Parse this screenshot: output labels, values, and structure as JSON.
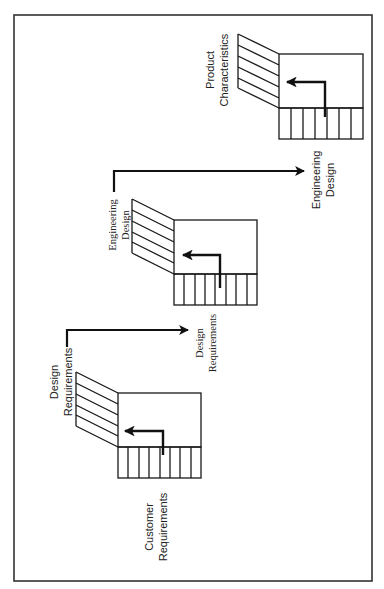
{
  "diagram": {
    "type": "QFD cascade (House of Quality chain), rotated 90°",
    "colors": {
      "stroke": "#1a1a1a",
      "background": "#ffffff",
      "text": "#222222"
    },
    "border": {
      "x": 14,
      "y": 15,
      "width": 358,
      "height": 566
    },
    "matrices": [
      {
        "id": "matrix-1",
        "name": "customer-to-design",
        "input_label": [
          "Customer",
          "Requirements"
        ],
        "output_label": [
          "Design",
          "Requirements"
        ],
        "box": {
          "x": 118,
          "y": 393,
          "w": 83,
          "h": 54
        },
        "stripe_h": 31,
        "skew_x": 76,
        "skew_rise": 21
      },
      {
        "id": "matrix-2",
        "name": "design-to-engineering",
        "input_label": [
          "Design",
          "Requirements"
        ],
        "output_label": [
          "Engineering",
          "Design"
        ],
        "box": {
          "x": 174,
          "y": 220,
          "w": 83,
          "h": 54
        },
        "stripe_h": 31,
        "skew_x": 132,
        "skew_rise": 21
      },
      {
        "id": "matrix-3",
        "name": "engineering-to-product",
        "input_label": [
          "Engineering",
          "Design"
        ],
        "output_label": [
          "Product",
          "Characteristics"
        ],
        "box": {
          "x": 279,
          "y": 54,
          "w": 84,
          "h": 54
        },
        "stripe_h": 31,
        "skew_x": 238,
        "skew_rise": 20
      }
    ],
    "labels": {
      "customer_requirements": [
        "Customer",
        "Requirements"
      ],
      "design_requirements_out": [
        "Design",
        "Requirements"
      ],
      "design_requirements_in": [
        "Design",
        "Requirements"
      ],
      "engineering_design_out": [
        "Engineering",
        "Design"
      ],
      "engineering_design_in": [
        "Engineering",
        "Design"
      ],
      "product_characteristics": [
        "Product",
        "Characteristics"
      ]
    },
    "connectors": [
      {
        "id": "connector-1",
        "from": "Design Requirements",
        "to": "Design Requirements",
        "points": [
          [
            67,
            347
          ],
          [
            67,
            330
          ],
          [
            192,
            330
          ]
        ]
      },
      {
        "id": "connector-2",
        "from": "Engineering Design",
        "to": "Engineering Design",
        "points": [
          [
            114,
            192
          ],
          [
            114,
            171
          ],
          [
            308,
            171
          ]
        ]
      }
    ]
  }
}
